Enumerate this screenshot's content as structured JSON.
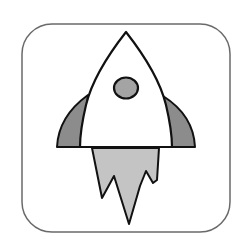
{
  "icon": {
    "name": "rocket-launch-icon",
    "label": "Rocket",
    "colors": {
      "background": "#ffffff",
      "frame_stroke": "#6a6a6a",
      "outline": "#111111",
      "body_fill": "#ffffff",
      "fin_fill": "#8c8c8c",
      "porthole_fill": "#a4a4a4",
      "flame_fill": "#c4c4c4"
    }
  }
}
